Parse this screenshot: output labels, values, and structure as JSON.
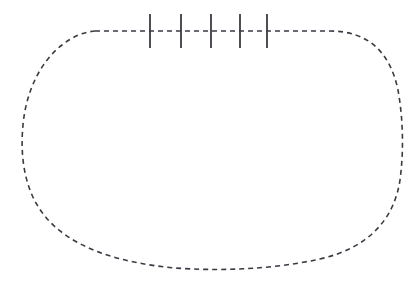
{
  "figure": {
    "title": "",
    "background_color": "#ffffff",
    "stroke_color": "#3a3a44",
    "canvas": {
      "width": 417,
      "height": 290
    },
    "contour": {
      "name": "closed-dashed-contour",
      "shape": "rounded-stadium",
      "style": "dashed",
      "stroke_width": 1.6,
      "dash_length": 5,
      "gap_length": 4,
      "bounds": {
        "left": 22,
        "top": 31,
        "right": 403,
        "bottom": 270
      },
      "flat_top": {
        "y": 31,
        "x_start": 95,
        "x_end": 330
      },
      "path": "M 95,31 L 330,31 C 368,31 390,52 398,90 C 403,118 404,150 400,180 C 394,220 368,248 320,259 C 270,270 215,271 175,268 C 120,263 70,248 44,215 C 24,190 20,155 23,125 C 26,92 40,62 62,45 C 72,37 83,32 95,31 Z"
    },
    "ticks": {
      "name": "tick-marks",
      "count": 5,
      "orientation": "vertical",
      "stroke_width": 1.8,
      "y_top": 14,
      "y_bottom": 48,
      "x_positions": [
        150,
        181,
        211,
        240,
        267
      ],
      "labels": [
        "",
        "",
        "",
        "",
        ""
      ]
    },
    "axis_line": {
      "name": "top-dashed-axis",
      "y": 31
    }
  }
}
